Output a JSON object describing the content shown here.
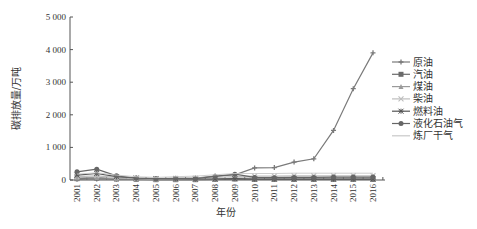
{
  "chart_data": {
    "type": "line",
    "title": "",
    "xlabel": "年份",
    "ylabel": "碳排放量/万吨",
    "ylim": [
      0,
      5000
    ],
    "yticks": [
      0,
      1000,
      2000,
      3000,
      4000,
      5000
    ],
    "ytick_labels": [
      "0",
      "1 000",
      "2 000",
      "3 000",
      "4 000",
      "5 000"
    ],
    "x": [
      "2001",
      "2002",
      "2003",
      "2004",
      "2005",
      "2006",
      "2007",
      "2008",
      "2009",
      "2010",
      "2011",
      "2012",
      "2013",
      "2014",
      "2015",
      "2016"
    ],
    "grid": false,
    "legend_position": "right",
    "series": [
      {
        "name": "原油",
        "marker": "plus",
        "color": "#7a7a7a",
        "values": [
          20,
          30,
          20,
          20,
          30,
          40,
          60,
          120,
          160,
          370,
          380,
          550,
          650,
          1520,
          2800,
          3900
        ]
      },
      {
        "name": "汽油",
        "marker": "square",
        "color": "#6a6a6a",
        "values": [
          40,
          60,
          30,
          20,
          10,
          10,
          10,
          20,
          30,
          20,
          20,
          20,
          20,
          20,
          20,
          20
        ]
      },
      {
        "name": "煤油",
        "marker": "triangle",
        "color": "#9a9a9a",
        "values": [
          60,
          80,
          40,
          30,
          20,
          20,
          20,
          30,
          60,
          60,
          60,
          60,
          60,
          60,
          60,
          60
        ]
      },
      {
        "name": "柴油",
        "marker": "cross",
        "color": "#bdbdbd",
        "values": [
          100,
          130,
          80,
          50,
          40,
          50,
          60,
          80,
          100,
          120,
          120,
          130,
          130,
          130,
          130,
          130
        ]
      },
      {
        "name": "燃料油",
        "marker": "star",
        "color": "#555555",
        "values": [
          150,
          200,
          100,
          60,
          40,
          40,
          30,
          30,
          40,
          30,
          30,
          30,
          30,
          30,
          30,
          30
        ]
      },
      {
        "name": "液化石油气",
        "marker": "circle",
        "color": "#666666",
        "values": [
          250,
          330,
          130,
          60,
          40,
          50,
          40,
          110,
          180,
          80,
          70,
          80,
          80,
          90,
          90,
          90
        ]
      },
      {
        "name": "炼厂干气",
        "marker": "none",
        "color": "#c8c8c8",
        "values": [
          180,
          220,
          150,
          100,
          80,
          100,
          120,
          160,
          200,
          200,
          200,
          210,
          210,
          210,
          210,
          210
        ]
      }
    ]
  }
}
